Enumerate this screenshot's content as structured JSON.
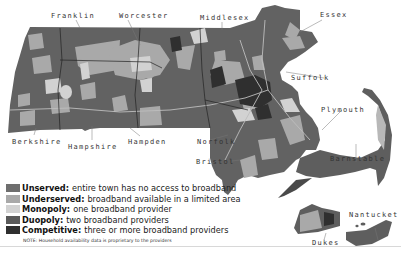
{
  "map": {
    "region": "Massachusetts",
    "colors": {
      "unserved": "#6e6e6e",
      "underserved": "#a9a9a9",
      "monopoly": "#d2d2d2",
      "duopoly": "#5a5a5a",
      "competitive": "#2f2f2f",
      "background": "#ffffff"
    },
    "county_labels": [
      {
        "name": "Franklin"
      },
      {
        "name": "Worcester"
      },
      {
        "name": "Middlesex"
      },
      {
        "name": "Essex"
      },
      {
        "name": "Suffolk"
      },
      {
        "name": "Plymouth"
      },
      {
        "name": "Berkshire"
      },
      {
        "name": "Hampshire"
      },
      {
        "name": "Hampden"
      },
      {
        "name": "Norfolk"
      },
      {
        "name": "Bristol"
      },
      {
        "name": "Barnstable"
      },
      {
        "name": "Nantucket"
      },
      {
        "name": "Dukes"
      }
    ]
  },
  "legend": {
    "items": [
      {
        "term": "Unserved:",
        "desc": "entire town has no access to broadband",
        "color": "#6e6e6e"
      },
      {
        "term": "Underserved:",
        "desc": "broadband available in a limited area",
        "color": "#a9a9a9"
      },
      {
        "term": "Monopoly:",
        "desc": "one broadband provider",
        "color": "#d2d2d2"
      },
      {
        "term": "Duopoly:",
        "desc": "two broadband providers",
        "color": "#5a5a5a"
      },
      {
        "term": "Competitive:",
        "desc": "three or more broadband providers",
        "color": "#2f2f2f"
      }
    ],
    "note": "NOTE: Household availability data is proprietary to the providers"
  }
}
